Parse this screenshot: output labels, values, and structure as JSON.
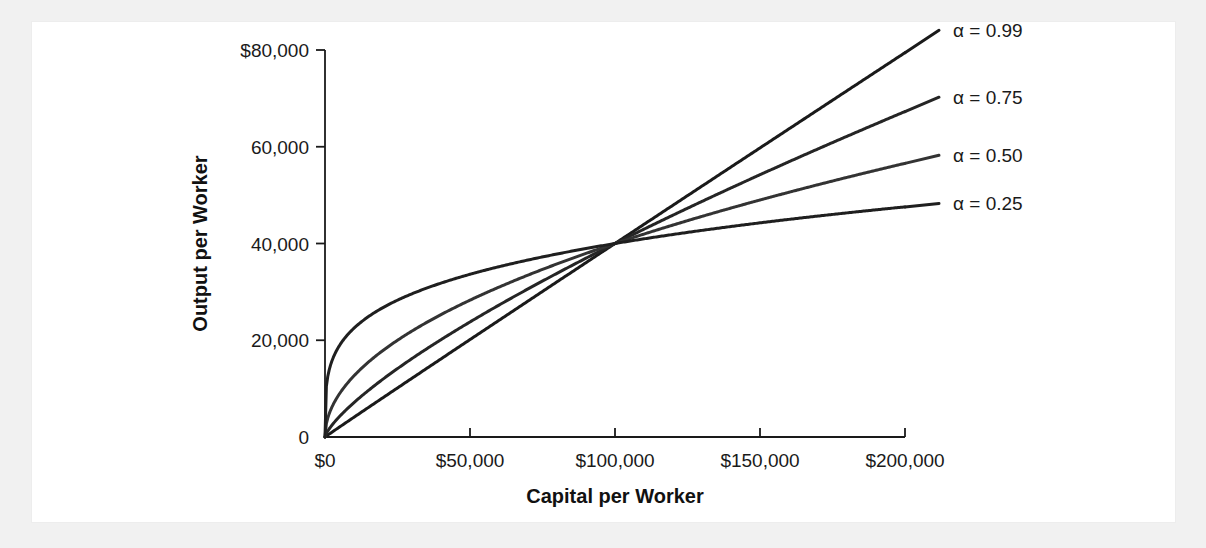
{
  "figure": {
    "background_color": "#f1f1f1",
    "panel_color": "#ffffff"
  },
  "chart_data": {
    "type": "line",
    "title": "",
    "xlabel": "Capital per Worker",
    "ylabel": "Output per Worker",
    "xlim": [
      0,
      200000
    ],
    "ylim": [
      0,
      80000
    ],
    "grid": false,
    "legend_position": "right-outside",
    "x_tick_labels": [
      "$0",
      "$50,000",
      "$100,000",
      "$150,000",
      "$200,000"
    ],
    "x_tick_values": [
      0,
      50000,
      100000,
      150000,
      200000
    ],
    "y_tick_labels": [
      "0",
      "20,000",
      "40,000",
      "60,000",
      "$80,000"
    ],
    "y_tick_values": [
      0,
      20000,
      40000,
      60000,
      80000
    ],
    "pivot_point": {
      "x": 100000,
      "y": 40000
    },
    "series": [
      {
        "name": "α = 0.99",
        "alpha": 0.99,
        "color": "#1a1a1a",
        "width": 3.0,
        "x": [
          0,
          10000,
          20000,
          30000,
          40000,
          50000,
          60000,
          70000,
          80000,
          90000,
          100000,
          120000,
          140000,
          160000,
          180000,
          200000
        ],
        "values": [
          0,
          4055,
          8074,
          12081,
          16081,
          20076,
          24067,
          28055,
          32041,
          36025,
          40000,
          47955,
          55902,
          63843,
          71779,
          79710
        ]
      },
      {
        "name": "α = 0.75",
        "alpha": 0.75,
        "color": "#252525",
        "width": 3.0,
        "x": [
          0,
          5000,
          10000,
          20000,
          30000,
          40000,
          50000,
          60000,
          70000,
          80000,
          90000,
          100000,
          120000,
          140000,
          160000,
          180000,
          200000
        ],
        "values": [
          0,
          5981,
          10057,
          16914,
          22921,
          28428,
          33593,
          38504,
          43216,
          47764,
          52177,
          40000,
          45763,
          51323,
          56715,
          61964,
          67272
        ]
      },
      {
        "name": "α = 0.50",
        "alpha": 0.5,
        "color": "#333333",
        "width": 3.0,
        "x": [
          0,
          5000,
          10000,
          20000,
          30000,
          40000,
          50000,
          60000,
          70000,
          80000,
          90000,
          100000,
          120000,
          140000,
          160000,
          180000,
          200000
        ],
        "values": [
          0,
          8944,
          12649,
          17889,
          21909,
          25298,
          28284,
          30984,
          33466,
          35777,
          37947,
          40000,
          43818,
          47329,
          50596,
          53666,
          56569
        ]
      },
      {
        "name": "α = 0.25",
        "alpha": 0.25,
        "color": "#1f1f1f",
        "width": 3.0,
        "x": [
          0,
          2000,
          5000,
          10000,
          20000,
          30000,
          40000,
          50000,
          60000,
          70000,
          80000,
          90000,
          100000,
          120000,
          140000,
          160000,
          180000,
          200000
        ],
        "values": [
          0,
          15340,
          18918,
          22494,
          26750,
          29604,
          31798,
          33601,
          35138,
          36481,
          37677,
          38757,
          40000,
          41878,
          43473,
          44865,
          46102,
          47568
        ]
      }
    ]
  }
}
